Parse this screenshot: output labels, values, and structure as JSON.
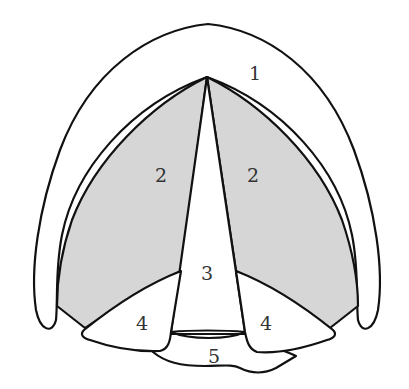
{
  "diagram": {
    "type": "anatomical-schematic",
    "colors": {
      "background": "#ffffff",
      "shaded_region": "#d6d6d6",
      "outline": "#111111",
      "label": "#333333"
    },
    "regions": [
      {
        "id": "1",
        "label": "1",
        "shaded": false
      },
      {
        "id": "2-left",
        "label": "2",
        "shaded": true
      },
      {
        "id": "2-right",
        "label": "2",
        "shaded": true
      },
      {
        "id": "3",
        "label": "3",
        "shaded": false
      },
      {
        "id": "4-left",
        "label": "4",
        "shaded": false
      },
      {
        "id": "4-right",
        "label": "4",
        "shaded": false
      },
      {
        "id": "5",
        "label": "5",
        "shaded": false
      }
    ],
    "labels": {
      "r1": "1",
      "r2_left": "2",
      "r2_right": "2",
      "r3": "3",
      "r4_left": "4",
      "r4_right": "4",
      "r5": "5"
    }
  }
}
